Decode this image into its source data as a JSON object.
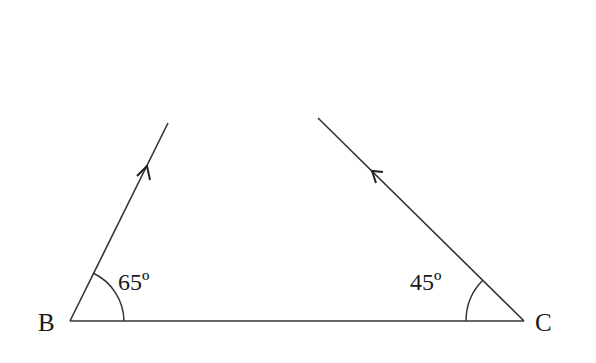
{
  "diagram": {
    "vertices": {
      "B": {
        "label": "B",
        "x": 70,
        "y": 321
      },
      "C": {
        "label": "C",
        "x": 524,
        "y": 321
      }
    },
    "angles": {
      "at_B": {
        "label": "65º",
        "degrees": 65
      },
      "at_C": {
        "label": "45º",
        "degrees": 45
      }
    },
    "rays": [
      {
        "from": "B",
        "direction": "up-right",
        "arrow": "pointing away from B"
      },
      {
        "from": "C",
        "direction": "up-left",
        "arrow": "pointing away from C"
      }
    ],
    "colors": {
      "stroke": "#333333",
      "text": "#1a1a1a",
      "background": "#ffffff"
    }
  }
}
